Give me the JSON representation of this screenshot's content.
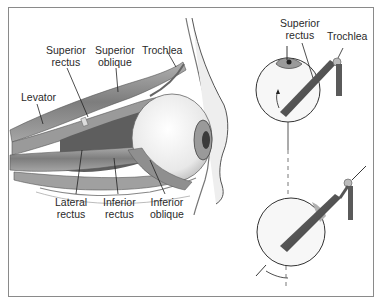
{
  "figure": {
    "type": "anatomical-illustration",
    "left_panel": {
      "labels": [
        {
          "id": "superior-rectus",
          "text": "Superior\nrectus"
        },
        {
          "id": "superior-oblique",
          "text": "Superior\noblique"
        },
        {
          "id": "trochlea",
          "text": "Trochlea"
        },
        {
          "id": "levator",
          "text": "Levator"
        },
        {
          "id": "lateral-rectus",
          "text": "Lateral\nrectus"
        },
        {
          "id": "inferior-rectus",
          "text": "Inferior\nrectus"
        },
        {
          "id": "inferior-oblique",
          "text": "Inferior\noblique"
        }
      ]
    },
    "right_panel": {
      "labels": [
        {
          "id": "superior-rectus",
          "text": "Superior\nrectus"
        },
        {
          "id": "trochlea",
          "text": "Trochlea"
        }
      ]
    },
    "colors": {
      "frame": "#8a8a8a",
      "muscle": "#8c8c8c",
      "muscle_dark": "#5a5a5a",
      "eyeball": "#f4f4f4",
      "outline": "#3a3a3a"
    }
  }
}
